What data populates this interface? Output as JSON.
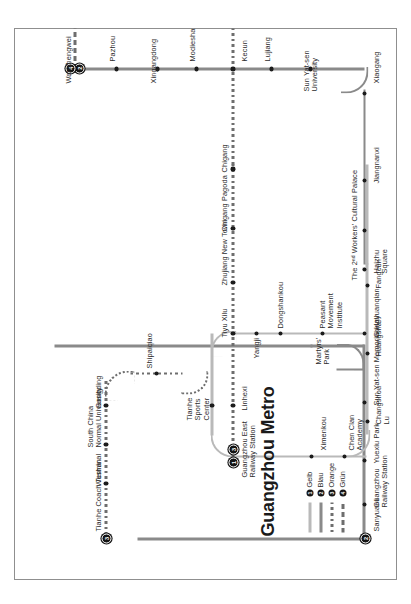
{
  "title": "Guangzhou Metro",
  "legend": {
    "items": [
      {
        "num": "1",
        "label": "Gelb",
        "color": "#b9b9b9",
        "style": "solid"
      },
      {
        "num": "2",
        "label": "Blau",
        "color": "#8a8a8a",
        "style": "solid"
      },
      {
        "num": "3",
        "label": "Orange",
        "color": "#9a9a9a",
        "style": "dotted"
      },
      {
        "num": "4",
        "label": "Grün",
        "color": "#8f8f8f",
        "style": "dashed"
      }
    ]
  },
  "lines": [
    {
      "num": "1",
      "name": "Gelb",
      "color": "#b9b9b9"
    },
    {
      "num": "2",
      "name": "Blau",
      "color": "#8a8a8a"
    },
    {
      "num": "3",
      "name": "Orange",
      "color": "#9a9a9a"
    },
    {
      "num": "4",
      "name": "Grün",
      "color": "#8f8f8f"
    }
  ],
  "stations": {
    "tianhe_coach_terminal": "Tianhe Coach Terminal",
    "wushan": "Wushan",
    "south_china_normal_university": "South China\nNormal University",
    "gangding": "Gangding",
    "shipaiqiao": "Shipaiqiao",
    "tianhe_sports_center": "Tianhe\nSports\nCenter",
    "guangzhou_east_railway_station": "Guangzhou East\nRailway Station",
    "linhexi": "Linhexi",
    "tiyu_xilu": "Tiyu Xilu",
    "zhujiang_new_town": "Zhujiang New Town",
    "chigang_pagoda": "Chigang Pagoda",
    "chigang": "Chigang",
    "kecun": "Kecun",
    "modiesha": "Modiesha",
    "xingangdong": "Xingangdong",
    "pazhou": "Pazhou",
    "wanshengwei": "Wanshengwei",
    "lujiang": "Lujiang",
    "sun_yat_sen_university": "Sun Yat-sen\nUniversity",
    "xiaogang": "Xiaogang",
    "jiangnanxi": "Jiangnanxi",
    "the_2nd_workers_cultural_palace": "The 2ⁿᵈ Workers' Cultural Palace",
    "haizhu_square": "Haizhu\nSquare",
    "gongyuanqian": "Gongyuanqian",
    "ximenkou": "Ximenkou",
    "chen_clan_academy": "Chen Clan\nAcademy",
    "changshou_lu": "Changshou\nLu",
    "huangsha": "Huangsha",
    "fangcun": "Fangcun",
    "sun_yat_sen_memorial_hall": "Sun Yat-sen Memorial Hall",
    "yuexiu_park": "Yuexiu Park",
    "guangzhou_railway_station": "Guangzhou\nRailway Station",
    "sanyuanli": "Sanyuanli",
    "yangji": "Yangji",
    "dongshankou": "Dongshankou",
    "martyrs_park": "Martyrs'\nPark",
    "peasant_movement_institute": "Peasant\nMovement\nInstitute"
  },
  "terminal_badges": {
    "tianhe_coach_terminal": "3",
    "guangzhou_east_a": "1",
    "guangzhou_east_b": "3",
    "sanyuanli": "2",
    "wanshengwei_a": "2",
    "wanshengwei_b": "4"
  }
}
